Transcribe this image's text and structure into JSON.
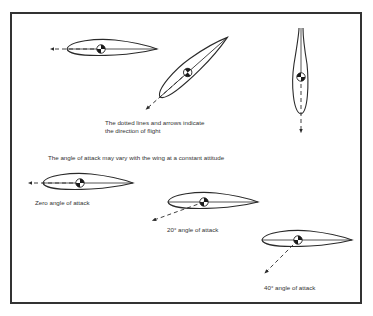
{
  "figure": {
    "caption_flight": {
      "line1": "The dotted lines and arrows indicate",
      "line2": "the direction of flight"
    },
    "caption_attitude": "The angle of attack may vary with the wing at a constant attitude",
    "examples": [
      {
        "label": "Zero angle of attack",
        "angle_deg": 0
      },
      {
        "label": "20° angle of attack",
        "angle_deg": 20
      },
      {
        "label": "40° angle of attack",
        "angle_deg": 40
      }
    ],
    "colors": {
      "line": "#2a2a2a",
      "frame": "#333333",
      "background": "#ffffff"
    }
  }
}
